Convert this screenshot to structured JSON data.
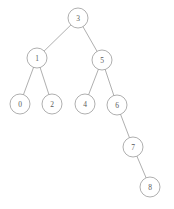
{
  "diagram": {
    "type": "binary-tree",
    "canvas": {
      "width": 174,
      "height": 209,
      "background": "#ffffff"
    },
    "style": {
      "node_radius": 10,
      "node_fill": "#ffffff",
      "node_stroke": "#9a9a9a",
      "edge_stroke": "#9a9a9a",
      "stroke_width": 0.8,
      "label_color": "#5a5a5a",
      "label_font_size": 7.5
    },
    "nodes": [
      {
        "id": "n3",
        "label": "3",
        "x": 78,
        "y": 18,
        "depth": 0,
        "role": "root"
      },
      {
        "id": "n1",
        "label": "1",
        "x": 37,
        "y": 58,
        "depth": 1,
        "role": "left-child"
      },
      {
        "id": "n5",
        "label": "5",
        "x": 102,
        "y": 60,
        "depth": 1,
        "role": "right-child"
      },
      {
        "id": "n0",
        "label": "0",
        "x": 20,
        "y": 104,
        "depth": 2,
        "role": "leaf"
      },
      {
        "id": "n2",
        "label": "2",
        "x": 52,
        "y": 104,
        "depth": 2,
        "role": "leaf"
      },
      {
        "id": "n4",
        "label": "4",
        "x": 85,
        "y": 104,
        "depth": 2,
        "role": "leaf"
      },
      {
        "id": "n6",
        "label": "6",
        "x": 117,
        "y": 105,
        "depth": 2,
        "role": "internal"
      },
      {
        "id": "n7",
        "label": "7",
        "x": 133,
        "y": 147,
        "depth": 3,
        "role": "internal"
      },
      {
        "id": "n8",
        "label": "8",
        "x": 150,
        "y": 187,
        "depth": 4,
        "role": "leaf"
      }
    ],
    "edges": [
      {
        "id": "e3-1",
        "from": "n3",
        "to": "n1",
        "x1": 78,
        "y1": 18,
        "x2": 37,
        "y2": 58
      },
      {
        "id": "e3-5",
        "from": "n3",
        "to": "n5",
        "x1": 78,
        "y1": 18,
        "x2": 102,
        "y2": 60
      },
      {
        "id": "e1-0",
        "from": "n1",
        "to": "n0",
        "x1": 37,
        "y1": 58,
        "x2": 20,
        "y2": 104
      },
      {
        "id": "e1-2",
        "from": "n1",
        "to": "n2",
        "x1": 37,
        "y1": 58,
        "x2": 52,
        "y2": 104
      },
      {
        "id": "e5-4",
        "from": "n5",
        "to": "n4",
        "x1": 102,
        "y1": 60,
        "x2": 85,
        "y2": 104
      },
      {
        "id": "e5-6",
        "from": "n5",
        "to": "n6",
        "x1": 102,
        "y1": 60,
        "x2": 117,
        "y2": 105
      },
      {
        "id": "e6-7",
        "from": "n6",
        "to": "n7",
        "x1": 117,
        "y1": 105,
        "x2": 133,
        "y2": 147
      },
      {
        "id": "e7-8",
        "from": "n7",
        "to": "n8",
        "x1": 133,
        "y1": 147,
        "x2": 150,
        "y2": 187
      }
    ]
  }
}
